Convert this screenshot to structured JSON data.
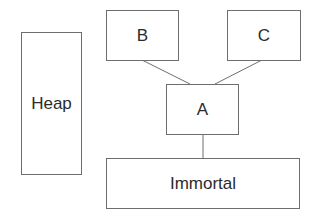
{
  "diagram": {
    "nodes": [
      {
        "id": "heap",
        "label": "Heap"
      },
      {
        "id": "b",
        "label": "B"
      },
      {
        "id": "c",
        "label": "C"
      },
      {
        "id": "a",
        "label": "A"
      },
      {
        "id": "immortal",
        "label": "Immortal"
      }
    ],
    "edges": [
      {
        "from": "b",
        "to": "a"
      },
      {
        "from": "c",
        "to": "a"
      },
      {
        "from": "a",
        "to": "immortal"
      }
    ],
    "colors": {
      "stroke": "#6e6e6e",
      "text": "#2b2b2b",
      "background": "#ffffff"
    }
  }
}
